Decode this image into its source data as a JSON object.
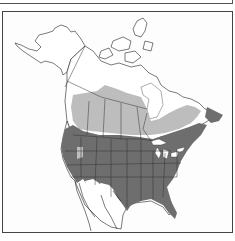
{
  "map": {
    "region": "North America",
    "type": "species range map",
    "legend_visible": false,
    "ranges": [
      {
        "name": "year-round range",
        "shade": "dark gray",
        "color": "#6e6e6e"
      },
      {
        "name": "breeding range",
        "shade": "light gray",
        "color": "#bdbdbd"
      }
    ]
  },
  "colors": {
    "background": "#ffffff",
    "outline": "#222222",
    "light": "#bdbdbd",
    "dark": "#6e6e6e"
  }
}
